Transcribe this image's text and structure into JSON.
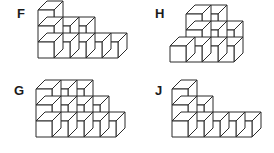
{
  "page": {
    "background_color": "#ffffff",
    "line_color": "#2b2b2b",
    "face_color": "#ffffff",
    "width": 274,
    "height": 153
  },
  "figures": [
    {
      "id": "F",
      "label": "F",
      "description": "Isometric cube stack, descending staircase",
      "columns": [
        3,
        2,
        2,
        1,
        1
      ],
      "cube_count": 9,
      "origin": {
        "x": 38,
        "y": 58
      },
      "cube_size": 16,
      "depth": 9
    },
    {
      "id": "H",
      "label": "H",
      "description": "Isometric cube stack, stepped block with tall centre",
      "columns": [
        1,
        3,
        3,
        2
      ],
      "cube_count": 9,
      "origin": {
        "x": 33,
        "y": 62
      },
      "cube_size": 16,
      "depth": 9
    },
    {
      "id": "G",
      "label": "G",
      "description": "Isometric cube stack, wide descending staircase",
      "columns": [
        3,
        3,
        3,
        2,
        1
      ],
      "cube_count": 12,
      "origin": {
        "x": 36,
        "y": 60
      },
      "cube_size": 16,
      "depth": 9
    },
    {
      "id": "J",
      "label": "J",
      "description": "Isometric cube stack, steep step then long flat run",
      "columns": [
        3,
        2,
        1,
        1,
        1
      ],
      "cube_count": 8,
      "origin": {
        "x": 35,
        "y": 60
      },
      "cube_size": 16,
      "depth": 9
    }
  ]
}
